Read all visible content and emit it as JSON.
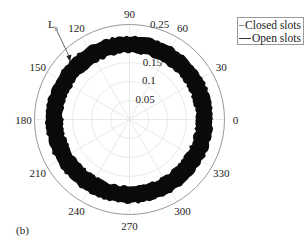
{
  "chart_data": {
    "type": "polar",
    "title": "",
    "panel_label": "(b)",
    "angular_ticks": [
      "0",
      "30",
      "60",
      "90",
      "120",
      "150",
      "180",
      "210",
      "240",
      "270",
      "300",
      "330"
    ],
    "radial_ticks": [
      "0.05",
      "0.1",
      "0.15",
      "0.25"
    ],
    "radial_max": 0.25,
    "grid": true,
    "annotation": {
      "text": "L",
      "subscript": "s",
      "target": "ring outer edge at ~130°"
    },
    "legend": {
      "position": "top-right",
      "entries": [
        "Closed slots",
        "Open slots"
      ]
    },
    "series": [
      {
        "name": "Closed slots",
        "description": "approximately circular ring",
        "r_min": 0.175,
        "r_max": 0.22,
        "theta_range": [
          0,
          360
        ]
      },
      {
        "name": "Open slots",
        "description": "approximately circular ring, overlapping",
        "r_min": 0.175,
        "r_max": 0.22,
        "theta_range": [
          0,
          360
        ]
      }
    ]
  },
  "legend": {
    "items": [
      {
        "label": "Closed slots",
        "color": "#888888"
      },
      {
        "label": "Open slots",
        "color": "#333333"
      }
    ]
  },
  "annotation": {
    "main": "L",
    "sub": "s"
  },
  "panel_label": "(b)"
}
